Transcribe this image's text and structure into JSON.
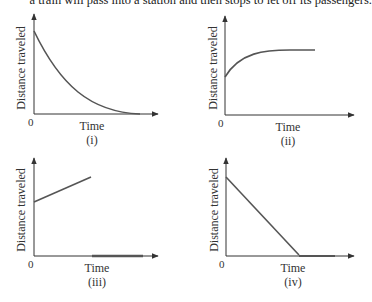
{
  "header": {
    "cropped_text": "a train will pass into a station and then stops to let off its passengers."
  },
  "panels": [
    {
      "id": "i",
      "caption": "(i)",
      "xlabel": "Time",
      "ylabel": "Distance traveled",
      "origin": "0",
      "description": "Decreasing curve approaching zero"
    },
    {
      "id": "ii",
      "caption": "(ii)",
      "xlabel": "Time",
      "ylabel": "Distance traveled",
      "origin": "0",
      "description": "Increasing curve leveling off"
    },
    {
      "id": "iii",
      "caption": "(iii)",
      "xlabel": "Time",
      "ylabel": "Distance traveled",
      "origin": "0",
      "description": "Increasing line then drop to zero flat segment"
    },
    {
      "id": "iv",
      "caption": "(iv)",
      "xlabel": "Time",
      "ylabel": "Distance traveled",
      "origin": "0",
      "description": "Linearly decreasing line then flat at zero"
    }
  ],
  "colors": {
    "axis": "#333333",
    "curve": "#555555",
    "text": "#333333"
  }
}
